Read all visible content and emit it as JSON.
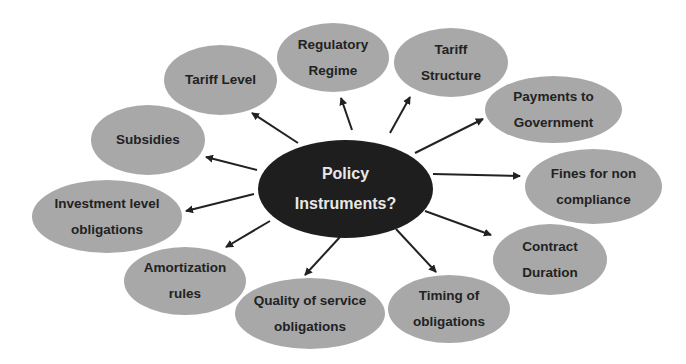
{
  "center": {
    "label": "Policy\nInstruments?"
  },
  "nodes": [
    {
      "id": "tariff-level",
      "label": "Tariff Level"
    },
    {
      "id": "regulatory-regime",
      "label": "Regulatory\nRegime"
    },
    {
      "id": "tariff-structure",
      "label": "Tariff\nStructure"
    },
    {
      "id": "payments-to-government",
      "label": "Payments to\nGovernment"
    },
    {
      "id": "fines-for-non-compliance",
      "label": "Fines for non\ncompliance"
    },
    {
      "id": "contract-duration",
      "label": "Contract\nDuration"
    },
    {
      "id": "timing-of-obligations",
      "label": "Timing of\nobligations"
    },
    {
      "id": "quality-of-service-obligations",
      "label": "Quality of service\nobligations"
    },
    {
      "id": "amortization-rules",
      "label": "Amortization\nrules"
    },
    {
      "id": "investment-level-obligations",
      "label": "Investment level\nobligations"
    },
    {
      "id": "subsidies",
      "label": "Subsidies"
    }
  ],
  "colors": {
    "node_fill": "#a8a8a8",
    "center_fill": "#1e1e1e",
    "arrow": "#222222"
  }
}
